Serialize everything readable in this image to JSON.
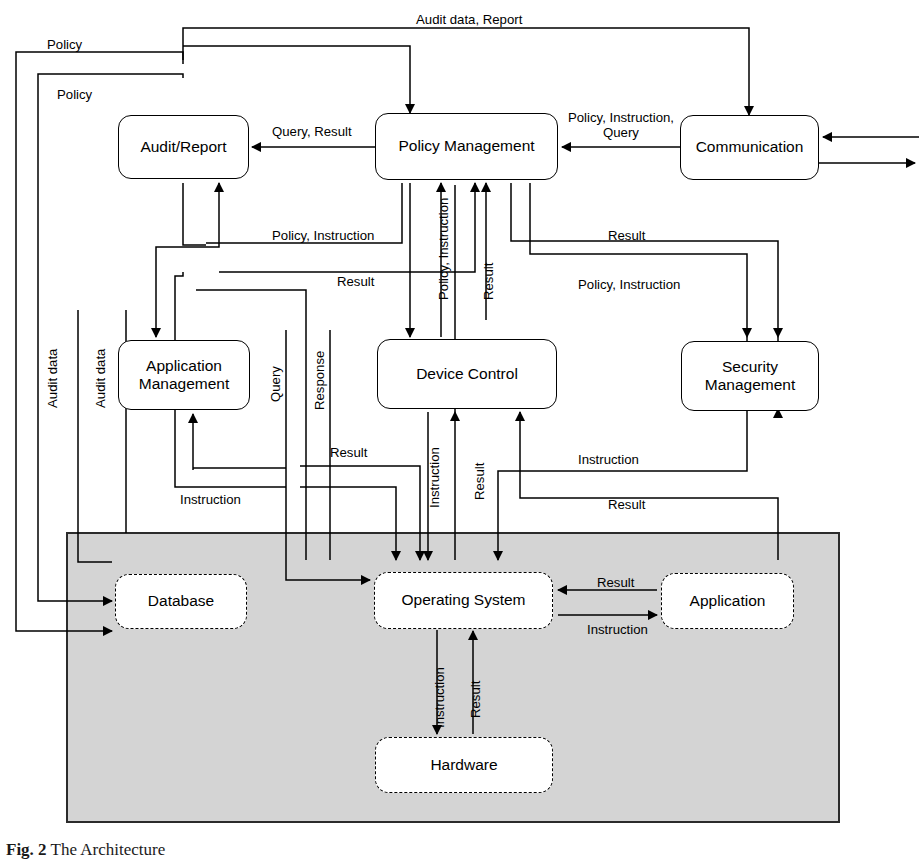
{
  "figure": {
    "caption_prefix": "Fig. 2",
    "caption_text": "The Architecture",
    "background": "#ffffff",
    "shaded_region_color": "#d4d4d4",
    "line_color": "#000000"
  },
  "nodes": [
    {
      "id": "audit-report",
      "label": "Audit/Report",
      "style": "solid",
      "x": 118,
      "y": 115,
      "w": 131,
      "h": 64
    },
    {
      "id": "policy-management",
      "label": "Policy Management",
      "style": "solid",
      "x": 375,
      "y": 113,
      "w": 183,
      "h": 67
    },
    {
      "id": "communication",
      "label": "Communication",
      "style": "solid",
      "x": 680,
      "y": 115,
      "w": 139,
      "h": 65
    },
    {
      "id": "application-management",
      "label": "Application Management",
      "style": "solid",
      "x": 118,
      "y": 340,
      "w": 132,
      "h": 70
    },
    {
      "id": "device-control",
      "label": "Device Control",
      "style": "solid",
      "x": 377,
      "y": 339,
      "w": 180,
      "h": 70
    },
    {
      "id": "security-management",
      "label": "Security Management",
      "style": "solid",
      "x": 681,
      "y": 341,
      "w": 138,
      "h": 70
    },
    {
      "id": "database",
      "label": "Database",
      "style": "dashed",
      "x": 115,
      "y": 574,
      "w": 132,
      "h": 55
    },
    {
      "id": "operating-system",
      "label": "Operating System",
      "style": "dashed",
      "x": 374,
      "y": 572,
      "w": 179,
      "h": 57
    },
    {
      "id": "application",
      "label": "Application",
      "style": "dashed",
      "x": 661,
      "y": 573,
      "w": 133,
      "h": 56
    },
    {
      "id": "hardware",
      "label": "Hardware",
      "style": "dashed",
      "x": 375,
      "y": 737,
      "w": 178,
      "h": 56
    }
  ],
  "shaded_region": {
    "x": 67,
    "y": 533,
    "w": 772,
    "h": 289
  },
  "edge_labels": [
    {
      "id": "l-audit-data-report",
      "text": "Audit data, Report",
      "x": 416,
      "y": 12,
      "orient": "h"
    },
    {
      "id": "l-policy-1",
      "text": "Policy",
      "x": 47,
      "y": 37,
      "orient": "h"
    },
    {
      "id": "l-policy-2",
      "text": "Policy",
      "x": 57,
      "y": 87,
      "orient": "h"
    },
    {
      "id": "l-query-result",
      "text": "Query, Result",
      "x": 272,
      "y": 124,
      "orient": "h"
    },
    {
      "id": "l-policy-instruction-query",
      "text": "Policy, Instruction, Query",
      "x": 566,
      "y": 114,
      "orient": "h-center",
      "w": 104
    },
    {
      "id": "l-policy-instruction-ar",
      "text": "Policy, Instruction",
      "x": 272,
      "y": 228,
      "orient": "h"
    },
    {
      "id": "l-result-ar",
      "text": "Result",
      "x": 337,
      "y": 274,
      "orient": "h"
    },
    {
      "id": "l-result-pm-right",
      "text": "Result",
      "x": 608,
      "y": 228,
      "orient": "h"
    },
    {
      "id": "l-policy-instruction-sec",
      "text": "Policy, Instruction",
      "x": 578,
      "y": 277,
      "orient": "h"
    },
    {
      "id": "l-policy-instruction-dev",
      "text": "Policy, Instruction",
      "x": 441,
      "y": 197,
      "orient": "v"
    },
    {
      "id": "l-result-dev",
      "text": "Result",
      "x": 486,
      "y": 197,
      "orient": "v"
    },
    {
      "id": "l-audit-data-1",
      "text": "Audit data",
      "x": 50,
      "y": 345,
      "orient": "v"
    },
    {
      "id": "l-audit-data-2",
      "text": "Audit data",
      "x": 98,
      "y": 345,
      "orient": "v"
    },
    {
      "id": "l-query",
      "text": "Query",
      "x": 272,
      "y": 355,
      "orient": "v"
    },
    {
      "id": "l-response",
      "text": "Response",
      "x": 317,
      "y": 345,
      "orient": "v"
    },
    {
      "id": "l-result-am",
      "text": "Result",
      "x": 330,
      "y": 445,
      "orient": "h"
    },
    {
      "id": "l-instruction-am",
      "text": "Instruction",
      "x": 180,
      "y": 492,
      "orient": "h"
    },
    {
      "id": "l-instruction-os-dev",
      "text": "Instruction",
      "x": 432,
      "y": 440,
      "orient": "v"
    },
    {
      "id": "l-result-os-dev",
      "text": "Result",
      "x": 477,
      "y": 443,
      "orient": "v"
    },
    {
      "id": "l-instruction-sec",
      "text": "Instruction",
      "x": 578,
      "y": 452,
      "orient": "h"
    },
    {
      "id": "l-result-sec",
      "text": "Result",
      "x": 608,
      "y": 497,
      "orient": "h"
    },
    {
      "id": "l-result-app",
      "text": "Result",
      "x": 597,
      "y": 575,
      "orient": "h"
    },
    {
      "id": "l-instruction-app",
      "text": "Instruction",
      "x": 587,
      "y": 622,
      "orient": "h"
    },
    {
      "id": "l-instruction-hw",
      "text": "Instruction",
      "x": 437,
      "y": 665,
      "orient": "v"
    },
    {
      "id": "l-result-hw",
      "text": "Result",
      "x": 473,
      "y": 668,
      "orient": "v"
    }
  ]
}
